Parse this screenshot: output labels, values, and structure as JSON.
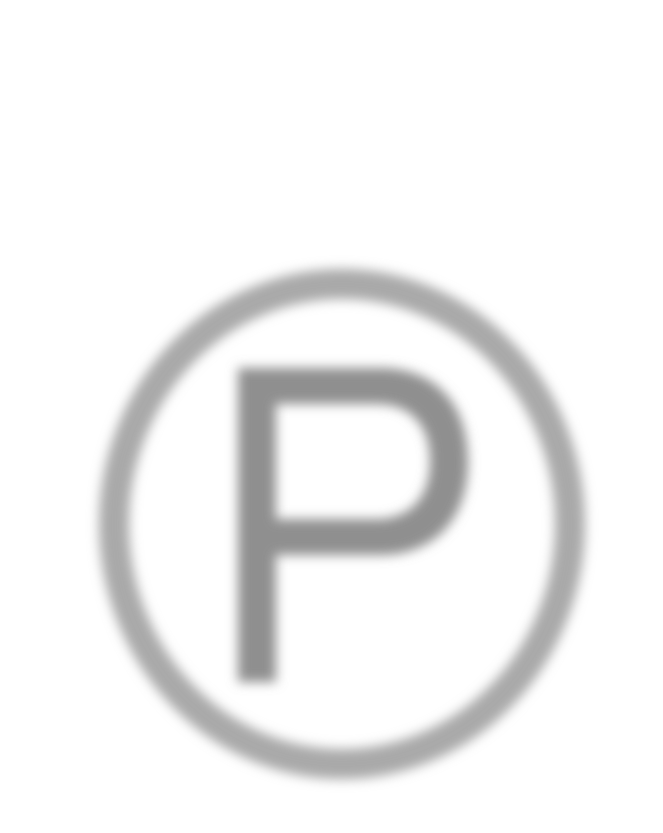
{
  "image": {
    "subject": "parking-sign-icon",
    "letter": "P",
    "background_color": "#ffffff",
    "ring_color": "#a9a9a9",
    "letter_color": "#8f8f8f",
    "blurred": true
  },
  "ring": {
    "center_x": 342,
    "center_y": 524,
    "radius_x": 228,
    "radius_y": 240,
    "stroke_width": 30
  },
  "glyph": {
    "stem_x": 238,
    "stem_top": 368,
    "stem_bottom": 682,
    "stem_width": 38,
    "bowl_right": 468,
    "bowl_bottom": 555
  }
}
